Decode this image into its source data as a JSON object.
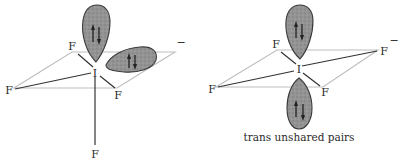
{
  "figure": {
    "left_diagram": {
      "central_atom": "I",
      "ligands": [
        "F",
        "F",
        "F",
        "F",
        "F"
      ],
      "charge": "−",
      "lone_pairs": 2,
      "lone_pair_arrangement": "cis"
    },
    "right_diagram": {
      "central_atom": "I",
      "ligands": [
        "F",
        "F",
        "F",
        "F"
      ],
      "charge": "−",
      "lone_pairs": 2,
      "caption": "trans unshared pairs"
    },
    "colors": {
      "lobe_fill": "#8e8e8e",
      "plane_outline": "#bdbdbd",
      "bond": "#333333"
    }
  }
}
